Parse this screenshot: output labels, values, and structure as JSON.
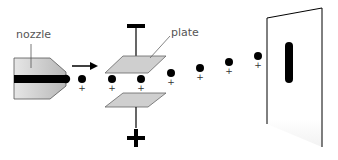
{
  "labels": {
    "nozzle": "nozzle",
    "plate": "plate",
    "negative_sign": "−",
    "positive_sign": "+",
    "droplet_charge": "+"
  },
  "colors": {
    "plate_fill": "#cfcfcf",
    "nozzle_fill": "#c8c8c8",
    "ink": "#000000",
    "label": "#555555"
  },
  "droplets": [
    {
      "x": 82,
      "y": 79
    },
    {
      "x": 112,
      "y": 79
    },
    {
      "x": 141,
      "y": 79
    },
    {
      "x": 171,
      "y": 73
    },
    {
      "x": 200,
      "y": 68
    },
    {
      "x": 229,
      "y": 62
    },
    {
      "x": 258,
      "y": 56
    }
  ]
}
